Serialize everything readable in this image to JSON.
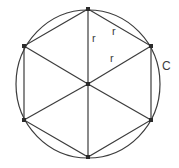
{
  "figure": {
    "background_color": "#ffffff",
    "stroke_color": "#3c3c3c",
    "vertex_color": "#2b2b2b",
    "canvas": {
      "width": 179,
      "height": 168
    },
    "circle": {
      "center_x": 88,
      "center_y": 84,
      "radius_x": 72,
      "radius_y": 74
    },
    "hexagon": {
      "vertices": [
        {
          "name": "top",
          "x": 88,
          "y": 9
        },
        {
          "name": "upper-right",
          "x": 151,
          "y": 46
        },
        {
          "name": "lower-right",
          "x": 151,
          "y": 120
        },
        {
          "name": "bottom",
          "x": 88,
          "y": 157
        },
        {
          "name": "lower-left",
          "x": 24,
          "y": 120
        },
        {
          "name": "upper-left",
          "x": 24,
          "y": 46
        }
      ],
      "center": {
        "name": "center",
        "x": 88,
        "y": 84
      }
    },
    "labels": {
      "radius_1": {
        "text": "r",
        "x": 92,
        "y": 33
      },
      "radius_2": {
        "text": "r",
        "x": 112,
        "y": 26
      },
      "radius_3": {
        "text": "r",
        "x": 110,
        "y": 53
      },
      "circumference": {
        "text": "C",
        "x": 162,
        "y": 60
      }
    }
  }
}
